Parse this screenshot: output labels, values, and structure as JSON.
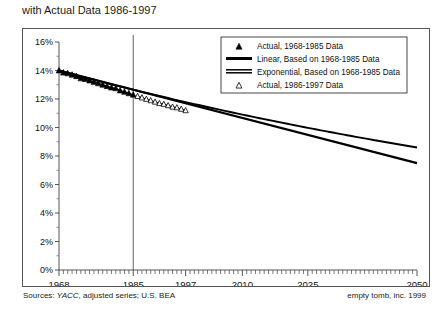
{
  "title": "with Actual Data 1986-1997",
  "footer": {
    "sources_prefix": "Sources: ",
    "sources_italic": "YACC",
    "sources_rest": ", adjusted series; U.S. BEA",
    "sources_full": "Sources: YACC, adjusted series; U.S. BEA",
    "credit": "empty tomb, inc. 1999"
  },
  "legend": {
    "position": "top-right",
    "items": [
      {
        "label": "Actual, 1968-1985 Data",
        "marker": "filled-triangle"
      },
      {
        "label": "Linear, Based on 1968-1985 Data",
        "marker": "thick-line"
      },
      {
        "label": "Exponential, Based on 1968-1985 Data",
        "marker": "double-line"
      },
      {
        "label": "Actual, 1986-1997 Data",
        "marker": "open-triangle"
      }
    ]
  },
  "chart_data": {
    "type": "line",
    "title": "with Actual Data 1986-1997",
    "xlabel": "",
    "ylabel": "",
    "grid": false,
    "xlim": [
      1968,
      2050
    ],
    "ylim": [
      0,
      16
    ],
    "ytick_labels": [
      "0%",
      "2%",
      "4%",
      "6%",
      "8%",
      "10%",
      "12%",
      "14%",
      "16%"
    ],
    "ytick_values": [
      0,
      2,
      4,
      6,
      8,
      10,
      12,
      14,
      16
    ],
    "xtick_labels": [
      "1968",
      "1985",
      "1997",
      "2010",
      "2025",
      "2050"
    ],
    "xtick_values": [
      1968,
      1985,
      1997,
      2010,
      2025,
      2050
    ],
    "reference_line_x": 1985,
    "series": [
      {
        "name": "Actual, 1968-1985 Data",
        "marker": "filled-triangle",
        "x": [
          1968,
          1969,
          1970,
          1971,
          1972,
          1973,
          1974,
          1975,
          1976,
          1977,
          1978,
          1979,
          1980,
          1981,
          1982,
          1983,
          1984,
          1985
        ],
        "values": [
          14.0,
          13.85,
          13.8,
          13.7,
          13.6,
          13.45,
          13.4,
          13.3,
          13.2,
          13.1,
          13.0,
          12.9,
          12.8,
          12.75,
          12.6,
          12.5,
          12.4,
          12.3
        ]
      },
      {
        "name": "Actual, 1986-1997 Data",
        "marker": "open-triangle",
        "x": [
          1986,
          1987,
          1988,
          1989,
          1990,
          1991,
          1992,
          1993,
          1994,
          1995,
          1996,
          1997
        ],
        "values": [
          12.2,
          12.1,
          12.0,
          11.9,
          11.8,
          11.7,
          11.65,
          11.55,
          11.45,
          11.4,
          11.3,
          11.2
        ]
      },
      {
        "name": "Linear, Based on 1968-1985 Data",
        "marker": "thick-line",
        "x": [
          1968,
          2050
        ],
        "values": [
          14.0,
          7.5
        ]
      },
      {
        "name": "Exponential, Based on 1968-1985 Data",
        "marker": "double-line",
        "x": [
          1968,
          1997,
          2010,
          2025,
          2050
        ],
        "values": [
          14.0,
          11.55,
          10.6,
          9.6,
          8.6
        ]
      }
    ]
  }
}
